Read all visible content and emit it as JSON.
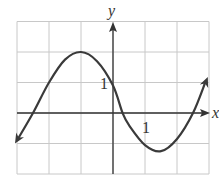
{
  "chart_data": {
    "type": "line",
    "title": "",
    "xlabel": "x",
    "ylabel": "y",
    "xlim": [
      -3,
      3
    ],
    "ylim": [
      -2,
      3
    ],
    "grid": true,
    "tick_labels": {
      "x": "1",
      "y": "1"
    },
    "series": [
      {
        "name": "f(x)",
        "x": [
          -3.0,
          -2.5,
          -2.0,
          -1.5,
          -1.0,
          -0.5,
          0.0,
          0.3,
          0.5,
          1.0,
          1.5,
          2.0,
          2.5,
          2.9
        ],
        "y": [
          -0.9,
          0.0,
          1.0,
          1.75,
          2.0,
          1.7,
          0.9,
          0.0,
          -0.4,
          -1.05,
          -1.25,
          -0.85,
          0.0,
          1.05
        ]
      }
    ],
    "arrows": {
      "curve_ends": true,
      "axes": true
    }
  },
  "colors": {
    "curve": "#3a3a3a",
    "axis": "#333333",
    "grid": "#c8c8c8"
  }
}
